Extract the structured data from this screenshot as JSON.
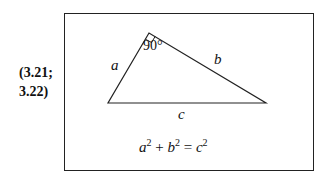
{
  "equation_number": {
    "line1": "(3.21;",
    "line2": "3.22)"
  },
  "triangle": {
    "side_a": "a",
    "side_b": "b",
    "side_c": "c",
    "right_angle_label": "90°",
    "vertices": {
      "top": [
        149,
        33
      ],
      "bottom_left": [
        108,
        103
      ],
      "bottom_right": [
        266,
        103
      ]
    }
  },
  "formula": {
    "a": "a",
    "b": "b",
    "c": "c",
    "exp": "2",
    "plus": "+",
    "eq": "="
  },
  "colors": {
    "line": "#222222",
    "background": "#ffffff"
  }
}
